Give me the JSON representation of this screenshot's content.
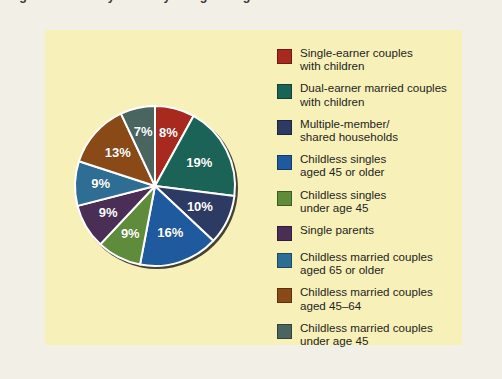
{
  "caption": {
    "text": "Figure 1  Diversity of family living arrangements in the United States"
  },
  "colors": {
    "page_background": "#f2f0e6",
    "panel_background": "#f7f0b8",
    "slice_separator": "#ffffff",
    "label_text": "#ffffff",
    "shadow": "#1d1b16"
  },
  "legend": {
    "items": [
      {
        "label": "Single-earner couples\nwith children",
        "color": "#a82a1e",
        "swatch_name": "legend-swatch-single-earner-couples"
      },
      {
        "label": "Dual-earner married couples\nwith children",
        "color": "#1a6356",
        "swatch_name": "legend-swatch-dual-earner-married-couples"
      },
      {
        "label": "Multiple-member/\nshared households",
        "color": "#2d3a63",
        "swatch_name": "legend-swatch-multiple-member-households"
      },
      {
        "label": "Childless singles\naged 45 or older",
        "color": "#1f5a9e",
        "swatch_name": "legend-swatch-childless-singles-45-or-older"
      },
      {
        "label": "Childless singles\nunder age 45",
        "color": "#5e8c3a",
        "swatch_name": "legend-swatch-childless-singles-under-45"
      },
      {
        "label": "Single parents",
        "color": "#4a2e55",
        "swatch_name": "legend-swatch-single-parents"
      },
      {
        "label": "Childless married couples\naged 65 or older",
        "color": "#2e6e94",
        "swatch_name": "legend-swatch-childless-married-65-or-older"
      },
      {
        "label": "Childless married couples\naged 45–64",
        "color": "#8a4a17",
        "swatch_name": "legend-swatch-childless-married-45-64"
      },
      {
        "label": "Childless married couples\nunder age 45",
        "color": "#4a6560",
        "swatch_name": "legend-swatch-childless-married-under-45"
      }
    ]
  },
  "chart_data": {
    "type": "pie",
    "title": "",
    "units": "percent",
    "total": 100,
    "start_angle_deg": 0,
    "direction": "clockwise",
    "legend_position": "right",
    "labels_shown": true,
    "categories": [
      "Single-earner couples with children",
      "Dual-earner married couples with children",
      "Multiple-member/shared households",
      "Childless singles aged 45 or older",
      "Childless singles under age 45",
      "Single parents",
      "Childless married couples aged 65 or older",
      "Childless married couples aged 45–64",
      "Childless married couples under age 45"
    ],
    "values": [
      8,
      19,
      10,
      16,
      9,
      9,
      9,
      13,
      7
    ],
    "value_labels": [
      "8%",
      "19%",
      "10%",
      "16%",
      "9%",
      "9%",
      "9%",
      "13%",
      "7%"
    ],
    "colors": [
      "#a82a1e",
      "#1a6356",
      "#2d3a63",
      "#1f5a9e",
      "#5e8c3a",
      "#4a2e55",
      "#2e6e94",
      "#8a4a17",
      "#4a6560"
    ]
  }
}
